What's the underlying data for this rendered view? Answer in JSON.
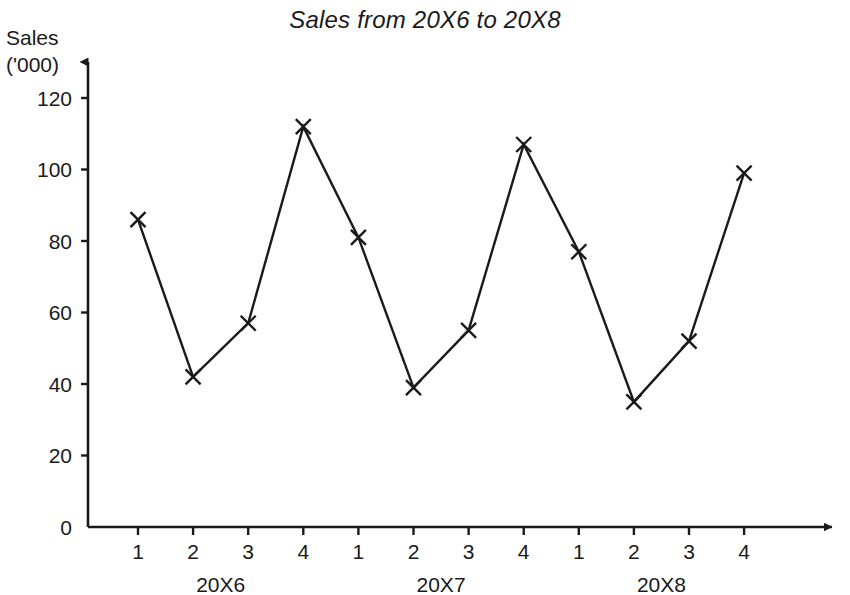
{
  "chart_data": {
    "type": "line",
    "title": "Sales from 20X6 to 20X8",
    "xlabel": "",
    "ylabel": "Sales ('000)",
    "ylabel_line1": "Sales",
    "ylabel_line2": "('000)",
    "ylim": [
      0,
      120
    ],
    "ytick_values": [
      0,
      20,
      40,
      60,
      80,
      100,
      120
    ],
    "ytick_labels": [
      "0",
      "20",
      "40",
      "60",
      "80",
      "100",
      "120"
    ],
    "grid": false,
    "legend": "none",
    "marker_style": "x",
    "line_color": "#1a1a1a",
    "categories": [
      "1",
      "2",
      "3",
      "4",
      "1",
      "2",
      "3",
      "4",
      "1",
      "2",
      "3",
      "4"
    ],
    "values": [
      86,
      42,
      57,
      112,
      81,
      39,
      55,
      107,
      77,
      35,
      52,
      99
    ],
    "group_labels": [
      "20X6",
      "20X7",
      "20X8"
    ],
    "groups": [
      {
        "label": "20X6",
        "quarters": [
          "1",
          "2",
          "3",
          "4"
        ],
        "values": [
          86,
          42,
          57,
          112
        ]
      },
      {
        "label": "20X7",
        "quarters": [
          "1",
          "2",
          "3",
          "4"
        ],
        "values": [
          81,
          39,
          55,
          107
        ]
      },
      {
        "label": "20X8",
        "quarters": [
          "1",
          "2",
          "3",
          "4"
        ],
        "values": [
          77,
          35,
          52,
          99
        ]
      }
    ],
    "axis_arrows": {
      "y": "up",
      "x": "right"
    }
  }
}
